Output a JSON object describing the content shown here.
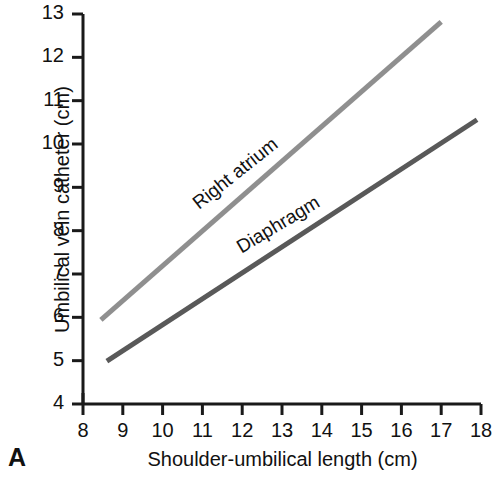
{
  "panel": {
    "label": "A"
  },
  "chart_data": {
    "type": "line",
    "title": "",
    "xlabel": "Shoulder-umbilical length (cm)",
    "ylabel": "Umbilical vein catheter (cm)",
    "xlim": [
      8,
      18
    ],
    "ylim": [
      4,
      13
    ],
    "xticks": [
      8,
      9,
      10,
      11,
      12,
      13,
      14,
      15,
      16,
      17,
      18
    ],
    "yticks": [
      4,
      5,
      6,
      7,
      8,
      9,
      10,
      11,
      12,
      13
    ],
    "xtick_labels": [
      "8",
      "9",
      "10",
      "11",
      "12",
      "13",
      "14",
      "15",
      "16",
      "17",
      "18"
    ],
    "ytick_labels": [
      "4",
      "5",
      "6",
      "7",
      "8",
      "9",
      "10",
      "11",
      "12",
      "13"
    ],
    "grid": false,
    "legend": "inline-annotation",
    "series": [
      {
        "name": "Right atrium",
        "color": "#8f8f8f",
        "linewidth": 5,
        "slope": 0.8,
        "intercept": -0.83,
        "x": [
          8.45,
          17.0
        ],
        "values": [
          5.94,
          12.82
        ],
        "label_x": 11.0,
        "label_y": 8.45,
        "label_angle": -38.5
      },
      {
        "name": "Diaphragm",
        "color": "#595959",
        "linewidth": 5,
        "slope": 0.6,
        "intercept": -0.17,
        "x": [
          8.6,
          17.9
        ],
        "values": [
          4.99,
          10.56
        ],
        "label_x": 12.05,
        "label_y": 7.45,
        "label_angle": -31.0
      }
    ],
    "axis_color": "#1a1a1a"
  }
}
